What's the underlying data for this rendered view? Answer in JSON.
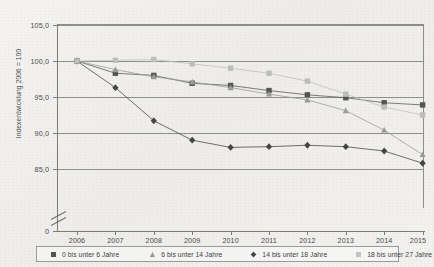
{
  "chart_data": {
    "type": "line",
    "title": "",
    "subtitle": "",
    "xlabel": "",
    "ylabel": "Indexentwicklung 2006 = 100",
    "x": [
      "2006",
      "2007",
      "2008",
      "2009",
      "2010",
      "2011",
      "2012",
      "2013",
      "2014",
      "2015"
    ],
    "categories": [
      "2006",
      "2007",
      "2008",
      "2009",
      "2010",
      "2011",
      "2012",
      "2013",
      "2014",
      "2015"
    ],
    "ylim": [
      85.0,
      105.0
    ],
    "yticks": [
      "105,0",
      "100,0",
      "95,0",
      "90,0",
      "85,0",
      "0"
    ],
    "ytick_values": [
      105.0,
      100.0,
      95.0,
      90.0,
      85.0,
      0
    ],
    "axis_break": true,
    "grid": true,
    "legend_position": "bottom",
    "series": [
      {
        "name": "0 bis unter 6 Jahre",
        "marker": "square",
        "color": "#555555",
        "values": [
          100.0,
          98.3,
          98.0,
          96.9,
          96.6,
          95.9,
          95.3,
          94.9,
          94.2,
          93.9
        ]
      },
      {
        "name": "6 bis unter 14 Jahre",
        "marker": "triangle",
        "color": "#9a9a9a",
        "values": [
          100.0,
          98.8,
          97.8,
          97.1,
          96.3,
          95.4,
          94.6,
          93.1,
          90.4,
          87.0
        ]
      },
      {
        "name": "14 bis unter 18 Jahre",
        "marker": "diamond",
        "color": "#444444",
        "values": [
          100.0,
          96.3,
          91.7,
          89.0,
          88.0,
          88.1,
          88.3,
          88.1,
          87.5,
          85.8
        ]
      },
      {
        "name": "18 bis unter 27 Jahre",
        "marker": "square-light",
        "color": "#bdbdbd",
        "values": [
          100.0,
          100.1,
          100.2,
          99.6,
          99.0,
          98.3,
          97.2,
          95.4,
          93.6,
          92.5
        ]
      }
    ]
  },
  "legend": {
    "items": [
      {
        "label": "0 bis unter 6 Jahre",
        "marker": "square",
        "color": "#555555"
      },
      {
        "label": "6 bis unter 14 Jahre",
        "marker": "triangle",
        "color": "#9a9a9a"
      },
      {
        "label": "14 bis unter 18 Jahre",
        "marker": "diamond",
        "color": "#444444"
      },
      {
        "label": "18 bis unter 27 Jahre",
        "marker": "square-light",
        "color": "#c4c4c4"
      }
    ]
  },
  "axis": {
    "y_title": "Indexentwicklung 2006 = 100",
    "y_labels": [
      "105,0",
      "100,0",
      "95,0",
      "90,0",
      "85,0",
      "0"
    ],
    "x_labels": [
      "2006",
      "2007",
      "2008",
      "2009",
      "2010",
      "2011",
      "2012",
      "2013",
      "2014",
      "2015"
    ]
  }
}
